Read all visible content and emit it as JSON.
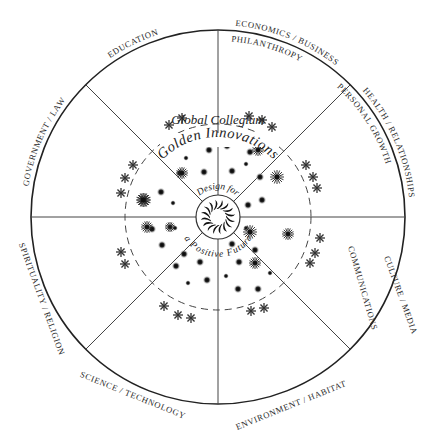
{
  "diagram": {
    "center": {
      "x": 218,
      "y": 217
    },
    "outer_radius": 187,
    "dashed_radius": 93,
    "hub_radius": 22,
    "line_color": "#333333",
    "title": "Global Collegium",
    "subtitle": "Golden Innovations",
    "hub_text_top": "Design for",
    "hub_text_bottom": "a Positive Future",
    "hub_icon": "sun-spiral-icon",
    "outer_labels": [
      {
        "id": "education",
        "text": "EDUCATION"
      },
      {
        "id": "economics-business",
        "text": "ECONOMICS / BUSINESS"
      },
      {
        "id": "health-relationships",
        "text": "HEALTH / RELATIONSHIPS"
      },
      {
        "id": "culture-media",
        "text": "CULTURE / MEDIA"
      },
      {
        "id": "environment-habitat",
        "text": "ENVIRONMENT / HABITAT"
      },
      {
        "id": "science-technology",
        "text": "SCIENCE / TECHNOLOGY"
      },
      {
        "id": "spirituality-religion",
        "text": "SPIRITUALITY / RELIGION"
      },
      {
        "id": "government-law",
        "text": "GOVERNMENT / LAW"
      }
    ],
    "inner_labels": [
      {
        "id": "philanthropy",
        "text": "PHILANTHROPY"
      },
      {
        "id": "personal-growth",
        "text": "PERSONAL GROWTH"
      },
      {
        "id": "communications",
        "text": "COMMUNICATIONS"
      }
    ],
    "divider_angles_deg": [
      -90,
      -45,
      0,
      45,
      90,
      135,
      180,
      225
    ]
  }
}
